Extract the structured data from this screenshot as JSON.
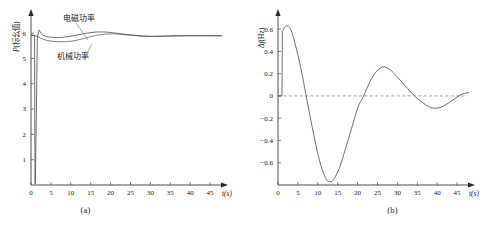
{
  "figure": {
    "panels": [
      {
        "id": "a",
        "caption": "(a)",
        "xlabel": "t(s)",
        "ylabel_italic": "P",
        "ylabel_rest": "(标幺值)",
        "xticks": [
          "0",
          "5",
          "10",
          "15",
          "20",
          "25",
          "30",
          "35",
          "40",
          "45"
        ],
        "yticks": [
          "1",
          "2",
          "3",
          "4",
          "5",
          "6"
        ],
        "annotations": [
          {
            "name": "electromagnetic-power",
            "text": "电磁功率"
          },
          {
            "name": "mechanical-power",
            "text": "机械功率"
          }
        ]
      },
      {
        "id": "b",
        "caption": "(b)",
        "xlabel": "t(s)",
        "ylabel_italic": "Δf",
        "ylabel_rest": "(Hz)",
        "xticks": [
          "0",
          "5",
          "10",
          "15",
          "20",
          "25",
          "30",
          "35",
          "40",
          "45"
        ],
        "yticks": [
          "0.6",
          "0.4",
          "0.2",
          "0",
          "-0.2",
          "-0.4",
          "-0.6"
        ]
      }
    ],
    "colors": {
      "curve": "#4a4a4a",
      "axis": "#3a3a3a",
      "zero_line": "#7a7a7a"
    }
  },
  "chart_data": [
    {
      "type": "line",
      "id": "a",
      "title": "",
      "xlabel": "t(s)",
      "ylabel": "P(标幺值)",
      "xlim": [
        0,
        48
      ],
      "ylim": [
        0,
        6.6
      ],
      "xticks": [
        0,
        5,
        10,
        15,
        20,
        25,
        30,
        35,
        40,
        45
      ],
      "yticks": [
        1,
        2,
        3,
        4,
        5,
        6
      ],
      "grid": false,
      "legend": "annotated-inline",
      "series": [
        {
          "name": "电磁功率",
          "x": [
            0,
            0.5,
            0.9,
            1.0,
            1.05,
            1.1,
            1.6,
            2.0,
            2.4,
            3.0,
            4.0,
            5.0,
            6.5,
            8.0,
            10.0,
            12.0,
            14.0,
            16.0,
            18.0,
            20.0,
            22.0,
            25.0,
            28.0,
            31.0,
            34.0,
            37.0,
            40.0,
            43.0,
            46.0,
            48.0
          ],
          "y": [
            5.92,
            5.92,
            5.92,
            0.05,
            0.05,
            0.05,
            5.8,
            6.12,
            6.02,
            5.92,
            5.86,
            5.84,
            5.83,
            5.84,
            5.88,
            5.94,
            6.0,
            6.04,
            6.05,
            6.03,
            5.99,
            5.93,
            5.89,
            5.88,
            5.89,
            5.9,
            5.9,
            5.9,
            5.9,
            5.9
          ]
        },
        {
          "name": "机械功率",
          "x": [
            0,
            1.0,
            2.0,
            3.0,
            4.5,
            6.0,
            8.0,
            10.0,
            12.0,
            14.0,
            16.0,
            18.0,
            20.0,
            22.0,
            25.0,
            28.0,
            31.0,
            34.0,
            37.0,
            40.0,
            43.0,
            46.0,
            48.0
          ],
          "y": [
            5.92,
            5.9,
            5.84,
            5.76,
            5.7,
            5.67,
            5.66,
            5.68,
            5.74,
            5.82,
            5.9,
            5.95,
            5.97,
            5.96,
            5.92,
            5.88,
            5.87,
            5.88,
            5.89,
            5.9,
            5.9,
            5.9,
            5.9
          ]
        }
      ]
    },
    {
      "type": "line",
      "id": "b",
      "title": "",
      "xlabel": "t(s)",
      "ylabel": "Δf(Hz)",
      "xlim": [
        0,
        48
      ],
      "ylim": [
        -0.8,
        0.7
      ],
      "xticks": [
        0,
        5,
        10,
        15,
        20,
        25,
        30,
        35,
        40,
        45
      ],
      "yticks": [
        0.6,
        0.4,
        0.2,
        0,
        -0.2,
        -0.4,
        -0.6
      ],
      "grid": false,
      "zero_line": true,
      "series": [
        {
          "name": "Δf",
          "x": [
            0,
            1.0,
            1.1,
            1.6,
            2.2,
            2.8,
            3.5,
            4.5,
            5.5,
            6.5,
            7.5,
            9.0,
            10.5,
            12.0,
            13.0,
            14.0,
            15.5,
            17.0,
            18.5,
            20.0,
            21.5,
            23.0,
            24.5,
            26.3,
            28.0,
            30.0,
            32.0,
            34.3,
            36.0,
            38.0,
            39.5,
            41.0,
            43.0,
            45.0,
            46.5,
            48.0
          ],
          "y": [
            0.0,
            0.0,
            0.58,
            0.61,
            0.63,
            0.62,
            0.57,
            0.44,
            0.29,
            0.11,
            -0.08,
            -0.35,
            -0.59,
            -0.74,
            -0.77,
            -0.75,
            -0.64,
            -0.47,
            -0.29,
            -0.11,
            0.0,
            0.12,
            0.21,
            0.26,
            0.24,
            0.17,
            0.09,
            0.0,
            -0.05,
            -0.1,
            -0.11,
            -0.1,
            -0.06,
            -0.01,
            0.02,
            0.03
          ]
        }
      ]
    }
  ]
}
